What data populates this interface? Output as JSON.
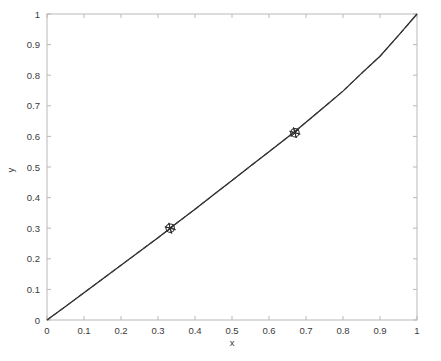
{
  "figure": {
    "background_color": "#ffffff",
    "plot_box": {
      "left": 47,
      "top": 14,
      "right": 417,
      "bottom": 320
    },
    "axis_color": "#b9b9b9",
    "line_color": "#242424",
    "marker_color": "#2a2a2a"
  },
  "chart_data": {
    "type": "line",
    "title": "",
    "xlabel": "x",
    "ylabel": "y",
    "xlim": [
      0,
      1
    ],
    "ylim": [
      0,
      1
    ],
    "xticks": [
      0,
      0.1,
      0.2,
      0.3,
      0.4,
      0.5,
      0.6,
      0.7,
      0.8,
      0.9,
      1
    ],
    "yticks": [
      0,
      0.1,
      0.2,
      0.3,
      0.4,
      0.5,
      0.6,
      0.7,
      0.8,
      0.9,
      1
    ],
    "xticklabels": [
      "0",
      "0.1",
      "0.2",
      "0.3",
      "0.4",
      "0.5",
      "0.6",
      "0.7",
      "0.8",
      "0.9",
      "1"
    ],
    "yticklabels": [
      "0",
      "0.1",
      "0.2",
      "0.3",
      "0.4",
      "0.5",
      "0.6",
      "0.7",
      "0.8",
      "0.9",
      "1"
    ],
    "grid": false,
    "legend": null,
    "tick_direction": "in",
    "series": [
      {
        "name": "solid-curve",
        "style": "solid",
        "color": "#242424",
        "x": [
          0.0,
          0.05,
          0.1,
          0.15,
          0.2,
          0.25,
          0.3,
          0.3333,
          0.35,
          0.4,
          0.45,
          0.5,
          0.55,
          0.6,
          0.6667,
          0.7,
          0.75,
          0.8,
          0.85,
          0.9,
          0.95,
          1.0
        ],
        "y": [
          0.0,
          0.044,
          0.089,
          0.134,
          0.179,
          0.224,
          0.269,
          0.3,
          0.316,
          0.362,
          0.409,
          0.456,
          0.503,
          0.55,
          0.613,
          0.646,
          0.697,
          0.748,
          0.806,
          0.862,
          0.93,
          1.0
        ]
      },
      {
        "name": "dashed-curve",
        "style": "dashed",
        "color": "#3b3b3b",
        "x": [
          0.0,
          0.05,
          0.1,
          0.15,
          0.2,
          0.25,
          0.3,
          0.3333,
          0.35,
          0.4,
          0.45,
          0.5,
          0.55,
          0.6,
          0.6667,
          0.7,
          0.75,
          0.8,
          0.85,
          0.9,
          0.95,
          1.0
        ],
        "y": [
          0.0,
          0.044,
          0.089,
          0.134,
          0.179,
          0.224,
          0.269,
          0.3,
          0.316,
          0.362,
          0.409,
          0.456,
          0.503,
          0.55,
          0.613,
          0.646,
          0.697,
          0.748,
          0.806,
          0.862,
          0.93,
          1.0
        ]
      }
    ],
    "markers": [
      {
        "name": "marker-point-1",
        "x": 0.333,
        "y": 0.3,
        "shape": "circle-star"
      },
      {
        "name": "marker-point-2",
        "x": 0.67,
        "y": 0.612,
        "shape": "circle-star"
      }
    ]
  }
}
